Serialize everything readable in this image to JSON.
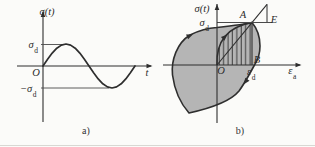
{
  "figure": {
    "caption_a": "a)",
    "caption_b": "b)",
    "panel_a": {
      "y_axis_label": "σ(t)",
      "amplitude": {
        "base": "σ",
        "sub": "d"
      },
      "neg_amplitude": {
        "base": "−σ",
        "sub": "d"
      },
      "origin_label": "O",
      "x_axis_label": "t",
      "curve": "sinusoidal stress cycle between +σd and −σd"
    },
    "panel_b": {
      "y_axis_label": "σ(t)",
      "stress_amplitude": {
        "base": "σ",
        "sub": "d"
      },
      "strain_amplitude": {
        "base": "ε",
        "sub": "d"
      },
      "x_axis_label": {
        "base": "ε",
        "sub": "a"
      },
      "origin_label": "O",
      "point_A": "A",
      "point_B": "B",
      "point_E": "E",
      "curve": "hysteresis loop through O and A with hatched area OAB and line OAE"
    },
    "colors": {
      "loop_fill": "#b5b5b5",
      "line": "#2e2e2e",
      "thin_line": "#4a4a4a",
      "background": "#fbfbf9"
    }
  }
}
